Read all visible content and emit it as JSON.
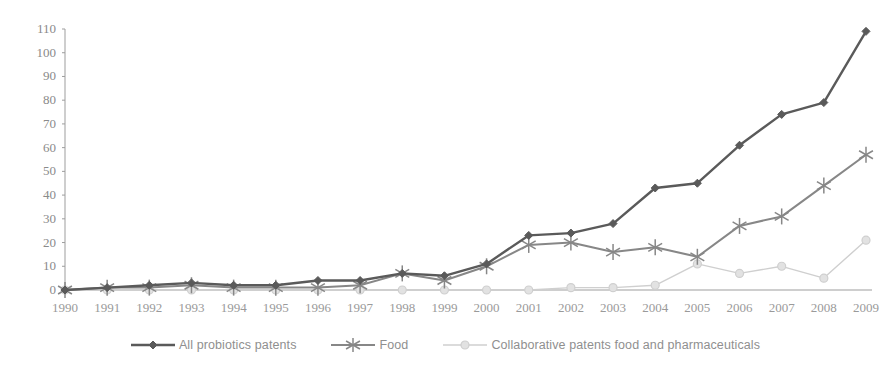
{
  "chart_data": {
    "type": "line",
    "title": "",
    "subtitle": "",
    "xlabel": "",
    "ylabel": "",
    "xlim": [
      1990,
      2009
    ],
    "ylim": [
      0,
      110
    ],
    "ytick_step": 10,
    "grid": false,
    "legend_position": "bottom",
    "categories": [
      "1990",
      "1991",
      "1992",
      "1993",
      "1994",
      "1995",
      "1996",
      "1997",
      "1998",
      "1999",
      "2000",
      "2001",
      "2002",
      "2003",
      "2004",
      "2005",
      "2006",
      "2007",
      "2008",
      "2009"
    ],
    "series": [
      {
        "name": "All probiotics patents",
        "color": "#5a5a5a",
        "marker": "diamond",
        "values": [
          0,
          1,
          2,
          3,
          2,
          2,
          4,
          4,
          7,
          6,
          11,
          23,
          24,
          28,
          43,
          45,
          61,
          74,
          79,
          109
        ]
      },
      {
        "name": "Food",
        "color": "#878787",
        "marker": "asterisk",
        "values": [
          0,
          1,
          1,
          2,
          1,
          1,
          1,
          2,
          7,
          4,
          10,
          19,
          20,
          16,
          18,
          14,
          27,
          31,
          44,
          57
        ]
      },
      {
        "name": "Collaborative patents food and pharmaceuticals",
        "color": "#cfcfcf",
        "marker": "circle",
        "values": [
          0,
          0,
          0,
          0,
          0,
          0,
          0,
          0,
          0,
          0,
          0,
          0,
          1,
          1,
          2,
          11,
          7,
          10,
          5,
          21
        ]
      }
    ],
    "ytick_labels": [
      "0",
      "10",
      "20",
      "30",
      "40",
      "50",
      "60",
      "70",
      "80",
      "90",
      "100",
      "110"
    ]
  },
  "legend": {
    "items": [
      {
        "label": "All probiotics patents"
      },
      {
        "label": "Food"
      },
      {
        "label": "Collaborative patents food and pharmaceuticals"
      }
    ]
  },
  "axes": {
    "axis_color": "#9d9d9d"
  }
}
